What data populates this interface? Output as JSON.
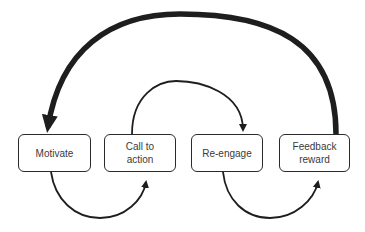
{
  "diagram": {
    "nodes": [
      {
        "id": "motivate",
        "label": "Motivate"
      },
      {
        "id": "call-to-action",
        "label": "Call to\naction"
      },
      {
        "id": "re-engage",
        "label": "Re-engage"
      },
      {
        "id": "feedback-reward",
        "label": "Feedback\nreward"
      }
    ],
    "edges": [
      {
        "from": "motivate",
        "to": "call-to-action",
        "route": "below"
      },
      {
        "from": "call-to-action",
        "to": "re-engage",
        "route": "above"
      },
      {
        "from": "re-engage",
        "to": "feedback-reward",
        "route": "below"
      },
      {
        "from": "feedback-reward",
        "to": "motivate",
        "route": "above",
        "style": "thick"
      }
    ],
    "colors": {
      "stroke": "#1e1e1e",
      "text": "#3a3a3a",
      "background": "#ffffff"
    }
  }
}
